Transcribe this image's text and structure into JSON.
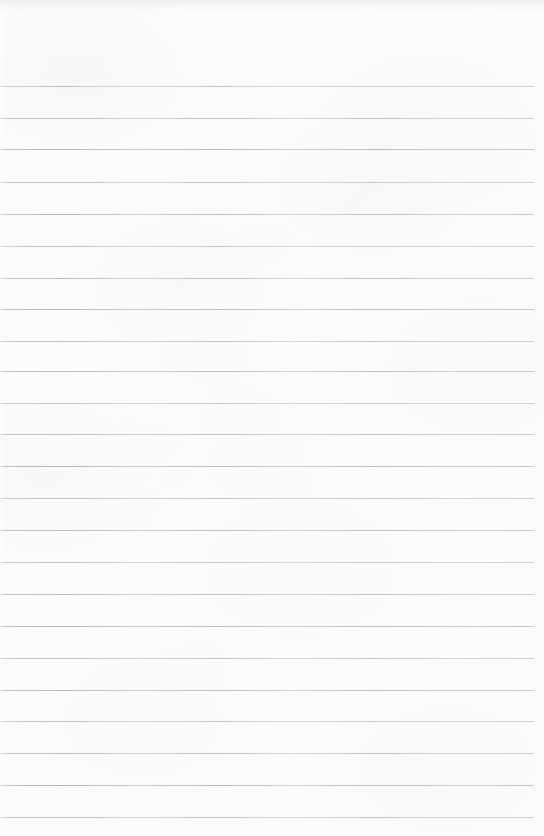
{
  "document": {
    "kind": "scanned-paper",
    "subject": "blank-ruled-notebook-page",
    "text_content": "",
    "is_blank": true,
    "width_px": 544,
    "height_px": 836
  },
  "paper": {
    "background_color": "#fcfcfc",
    "texture": "faint mottled gray-warm scan grain",
    "top_edge_shadow": true,
    "left_edge_light_band": true
  },
  "ruling": {
    "line_color": "#b8bec4",
    "line_thickness_px": 1,
    "line_spacing_px": 31.9,
    "first_line_y_px": 86,
    "line_start_x_px": 0,
    "line_end_x_px": 534,
    "right_margin_px": 10,
    "margin_rule": false,
    "line_count": 23,
    "line_y_positions": [
      86,
      118,
      149,
      182,
      214,
      246,
      278,
      309,
      341,
      371,
      403,
      434,
      466,
      498,
      530,
      562,
      594,
      626,
      658,
      690,
      721,
      753,
      785,
      817
    ]
  }
}
